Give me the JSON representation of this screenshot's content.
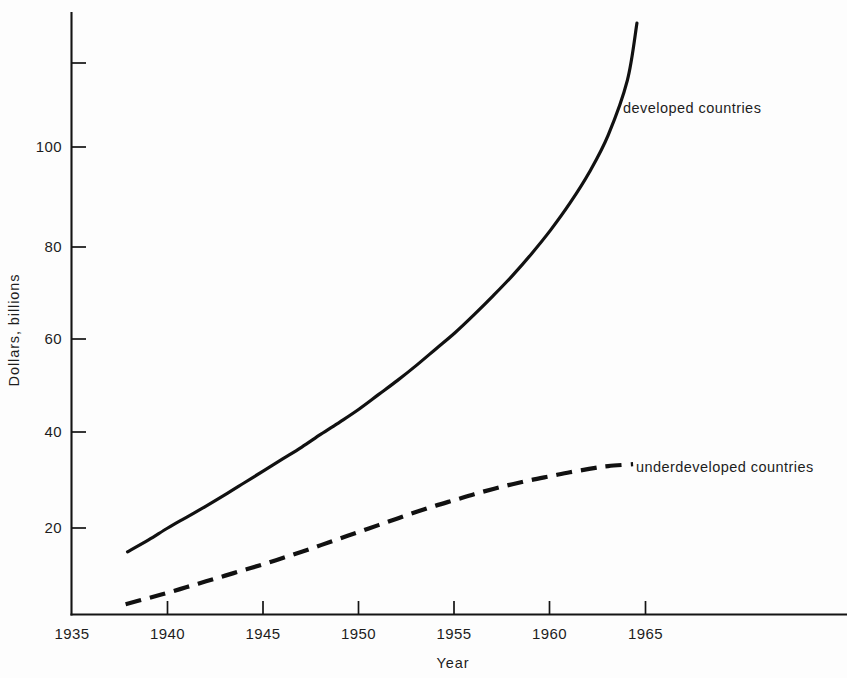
{
  "chart_data": {
    "type": "line",
    "title": "",
    "xlabel": "Year",
    "ylabel": "Dollars, billions",
    "xlim": [
      1935,
      1975
    ],
    "ylim": [
      0,
      126
    ],
    "grid": false,
    "legend_position": "inline-right-of-curve",
    "x_ticks": [
      1935,
      1940,
      1945,
      1950,
      1955,
      1960,
      1965
    ],
    "x_tick_labels": [
      "1935",
      "1940",
      "1945",
      "1950",
      "1955",
      "1960",
      "1965"
    ],
    "y_ticks": [
      20,
      40,
      60,
      80,
      100,
      120
    ],
    "y_tick_labels": [
      "20",
      "40",
      "60",
      "80",
      "100",
      ""
    ],
    "series": [
      {
        "name": "developed countries",
        "style": "solid",
        "label": "developed countries",
        "x": [
          1937.9,
          1939,
          1940,
          1941,
          1942,
          1943,
          1944,
          1945,
          1946,
          1947,
          1948,
          1949,
          1950,
          1951,
          1952,
          1953,
          1954,
          1955,
          1956,
          1957,
          1958,
          1959,
          1960,
          1961,
          1962,
          1963,
          1964,
          1964.5
        ],
        "values": [
          15,
          17.5,
          20,
          22.3,
          24.6,
          27,
          29.5,
          32,
          34.5,
          37,
          39.7,
          42.3,
          45,
          48,
          51,
          54.2,
          57.6,
          61,
          64.8,
          68.8,
          73,
          77.6,
          82.6,
          88.2,
          94.6,
          102.5,
          114,
          126
        ]
      },
      {
        "name": "underdeveloped countries",
        "style": "dashed",
        "label": "underdeveloped countries",
        "x": [
          1937.8,
          1939,
          1940,
          1941,
          1942,
          1943,
          1944,
          1945,
          1946,
          1947,
          1948,
          1949,
          1950,
          1951,
          1952,
          1953,
          1954,
          1955,
          1956,
          1957,
          1958,
          1959,
          1960,
          1961,
          1962,
          1963,
          1964.3
        ],
        "values": [
          4,
          5.3,
          6.4,
          7.6,
          8.8,
          10,
          11.2,
          12.4,
          13.7,
          15,
          16.4,
          17.8,
          19.2,
          20.6,
          22,
          23.4,
          24.7,
          25.9,
          27.1,
          28.2,
          29.2,
          30.1,
          30.9,
          31.7,
          32.4,
          33,
          33.4
        ]
      }
    ],
    "annotations": [
      {
        "text": "developed countries",
        "x": 1964,
        "y": 110
      },
      {
        "text": "underdeveloped countries",
        "x": 1964.4,
        "y": 33
      }
    ],
    "colors": {
      "curve": "#111111",
      "axis": "#141414",
      "background": "#fdfdfd",
      "text": "#1d1d1d"
    }
  },
  "labels": {
    "y_120": "",
    "y_100": "100",
    "y_80": "80",
    "y_60": "60",
    "y_40": "40",
    "y_20": "20",
    "x_1935": "1935",
    "x_1940": "1940",
    "x_1945": "1945",
    "x_1950": "1950",
    "x_1955": "1955",
    "x_1960": "1960",
    "x_1965": "1965",
    "axis_x_title": "Year",
    "axis_y_title": "Dollars, billions",
    "series_developed": "developed countries",
    "series_underdeveloped": "underdeveloped countries"
  }
}
